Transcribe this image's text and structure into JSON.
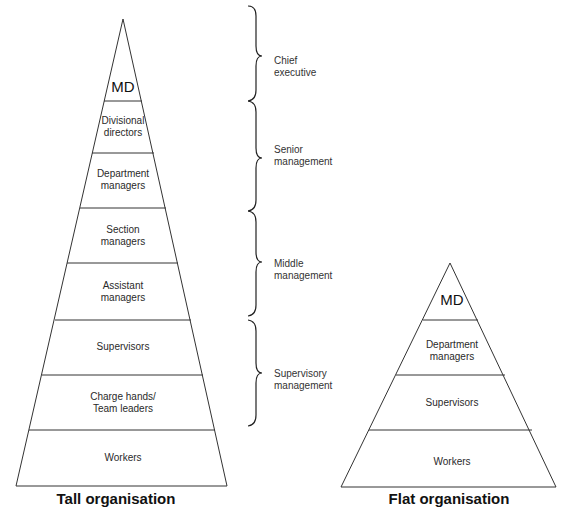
{
  "tall": {
    "title": "Tall organisation",
    "levels": [
      {
        "label": "MD"
      },
      {
        "line1": "Divisional",
        "line2": "directors"
      },
      {
        "line1": "Department",
        "line2": "managers"
      },
      {
        "line1": "Section",
        "line2": "managers"
      },
      {
        "line1": "Assistant",
        "line2": "managers"
      },
      {
        "label": "Supervisors"
      },
      {
        "line1": "Charge hands/",
        "line2": "Team leaders"
      },
      {
        "label": "Workers"
      }
    ]
  },
  "braces": [
    {
      "line1": "Chief",
      "line2": "executive"
    },
    {
      "line1": "Senior",
      "line2": "management"
    },
    {
      "line1": "Middle",
      "line2": "management"
    },
    {
      "line1": "Supervisory",
      "line2": "management"
    }
  ],
  "flat": {
    "title": "Flat organisation",
    "levels": [
      {
        "label": "MD"
      },
      {
        "line1": "Department",
        "line2": "managers"
      },
      {
        "label": "Supervisors"
      },
      {
        "label": "Workers"
      }
    ]
  }
}
